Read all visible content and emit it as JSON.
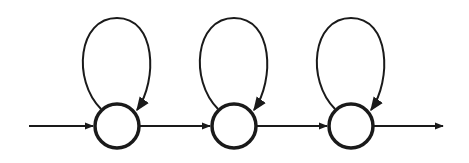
{
  "diagram": {
    "type": "state-chain",
    "colors": {
      "stroke": "#1a1a1a",
      "background": "#ffffff"
    },
    "states": [
      {
        "id": "s1",
        "cx": 117,
        "cy": 126,
        "r": 22,
        "self_loop": true
      },
      {
        "id": "s2",
        "cx": 234,
        "cy": 126,
        "r": 22,
        "self_loop": true
      },
      {
        "id": "s3",
        "cx": 351,
        "cy": 126,
        "r": 22,
        "self_loop": true
      }
    ],
    "transitions": [
      {
        "from": "entry",
        "to": "s1"
      },
      {
        "from": "s1",
        "to": "s2"
      },
      {
        "from": "s2",
        "to": "s3"
      },
      {
        "from": "s3",
        "to": "exit"
      }
    ]
  }
}
